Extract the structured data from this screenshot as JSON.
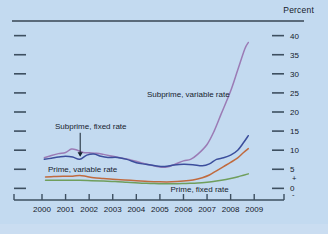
{
  "figure": {
    "unit_label": "Percent",
    "background_color": "#c3daf0",
    "axis_color": "#3d4f60"
  },
  "chart_data": {
    "type": "line",
    "title": "",
    "subtitle": "",
    "xlabel": "",
    "ylabel": "Percent",
    "ylim": [
      -2,
      42
    ],
    "xlim": [
      2000,
      2009.5
    ],
    "grid": false,
    "legend": "inline-annotations",
    "x_tick_labels": [
      "2000",
      "2001",
      "2002",
      "2003",
      "2004",
      "2005",
      "2006",
      "2007",
      "2008",
      "2009"
    ],
    "x_ticks": [
      2000,
      2001,
      2002,
      2003,
      2004,
      2005,
      2006,
      2007,
      2008,
      2009
    ],
    "y_tick_labels": [
      "40",
      "35",
      "30",
      "25",
      "20",
      "15",
      "10",
      "5",
      "0"
    ],
    "y_ticks": [
      40,
      35,
      30,
      25,
      20,
      15,
      10,
      5,
      0
    ],
    "zero_plus_sign": "+",
    "zero_minus_sign": "-",
    "series": [
      {
        "name": "Subprime, variable rate",
        "color": "#9b7bb5",
        "label_x": 2004.45,
        "label_y": 24.0,
        "x": [
          2000.1,
          2000.4,
          2000.7,
          2001.0,
          2001.25,
          2001.5,
          2001.75,
          2002.0,
          2002.3,
          2002.6,
          2003.0,
          2003.4,
          2003.8,
          2004.2,
          2004.6,
          2005.0,
          2005.3,
          2005.6,
          2006.0,
          2006.3,
          2006.6,
          2007.0,
          2007.3,
          2007.6,
          2008.0,
          2008.3,
          2008.6,
          2008.75
        ],
        "y": [
          8.0,
          8.6,
          9.1,
          9.4,
          10.3,
          10.0,
          9.4,
          9.3,
          9.2,
          8.9,
          8.4,
          7.9,
          7.4,
          6.7,
          6.1,
          5.6,
          5.6,
          6.2,
          7.2,
          7.6,
          8.9,
          11.5,
          15.0,
          19.5,
          25.5,
          31.0,
          36.5,
          38.2
        ]
      },
      {
        "name": "Prime, variable rate",
        "color": "#3b4e9c",
        "label_x": 2000.25,
        "label_y": 4.4,
        "x": [
          2000.1,
          2000.4,
          2000.7,
          2001.0,
          2001.3,
          2001.6,
          2001.9,
          2002.2,
          2002.5,
          2002.8,
          2003.2,
          2003.6,
          2004.0,
          2004.4,
          2004.8,
          2005.2,
          2005.6,
          2006.0,
          2006.4,
          2006.8,
          2007.1,
          2007.4,
          2007.7,
          2008.0,
          2008.3,
          2008.55,
          2008.75
        ],
        "y": [
          7.6,
          7.9,
          8.2,
          8.4,
          8.2,
          7.6,
          8.7,
          9.0,
          8.4,
          8.1,
          8.1,
          7.6,
          6.7,
          6.3,
          5.9,
          5.7,
          6.1,
          6.3,
          6.2,
          5.9,
          6.4,
          7.6,
          8.0,
          8.7,
          10.0,
          12.0,
          13.8
        ]
      },
      {
        "name": "Subprime, fixed rate",
        "color": "#c06a3e",
        "label_x": 2000.55,
        "label_y": 15.6,
        "arrow_to_x": 2001.62,
        "arrow_to_y": 8.05,
        "x": [
          2000.15,
          2000.5,
          2000.9,
          2001.3,
          2001.6,
          2001.9,
          2002.2,
          2002.6,
          2003.0,
          2003.5,
          2004.0,
          2004.5,
          2005.0,
          2005.5,
          2006.0,
          2006.4,
          2006.8,
          2007.1,
          2007.4,
          2007.7,
          2008.0,
          2008.3,
          2008.55,
          2008.75
        ],
        "y": [
          3.0,
          3.1,
          3.2,
          3.2,
          3.4,
          3.1,
          2.8,
          2.6,
          2.4,
          2.2,
          2.0,
          1.8,
          1.7,
          1.7,
          1.9,
          2.2,
          2.8,
          3.5,
          4.6,
          5.7,
          6.8,
          8.0,
          9.4,
          10.4
        ]
      },
      {
        "name": "Prime, fixed rate",
        "color": "#6f9e5c",
        "label_x": 2005.45,
        "label_y": -0.9,
        "x": [
          2000.15,
          2000.6,
          2001.1,
          2001.6,
          2002.1,
          2002.6,
          2003.1,
          2003.6,
          2004.1,
          2004.6,
          2005.1,
          2005.6,
          2006.1,
          2006.6,
          2007.0,
          2007.4,
          2007.8,
          2008.1,
          2008.4,
          2008.75
        ],
        "y": [
          2.1,
          2.1,
          2.1,
          2.1,
          2.0,
          1.9,
          1.8,
          1.6,
          1.4,
          1.3,
          1.2,
          1.2,
          1.3,
          1.4,
          1.6,
          1.9,
          2.3,
          2.7,
          3.2,
          3.8
        ]
      }
    ]
  }
}
